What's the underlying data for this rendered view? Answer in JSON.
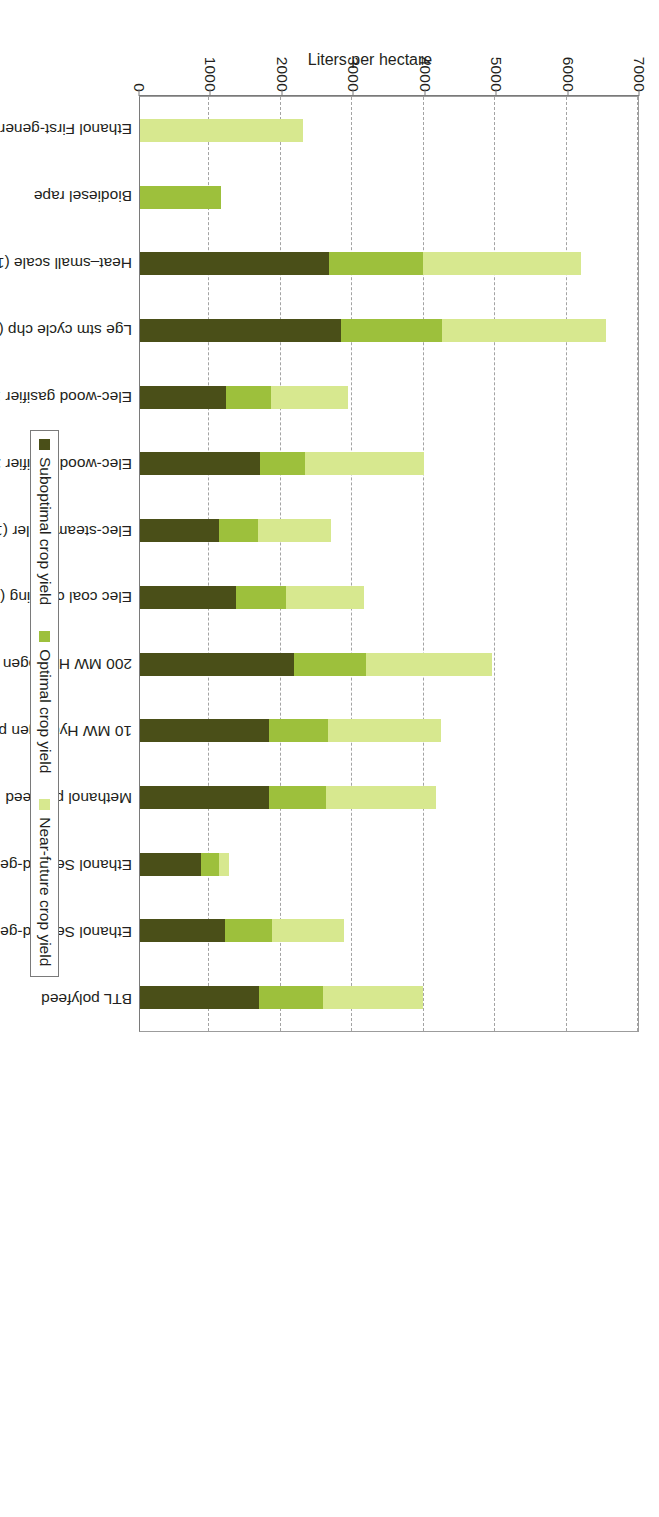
{
  "chart": {
    "type": "bar",
    "value_axis_title": "Liters per hectare",
    "value_axis_ticks": [
      "0",
      "1000",
      "2000",
      "3000",
      "4000",
      "5000",
      "6000",
      "7000"
    ]
  },
  "legend": {
    "items": [
      {
        "label": "Suboptimal crop yield",
        "color": "#4a4f18"
      },
      {
        "label": "Optimal crop yield",
        "color": "#9dc03c"
      },
      {
        "label": "Near-future crop yield",
        "color": "#d7e88f"
      }
    ]
  },
  "chart_data": {
    "type": "bar",
    "stacked": true,
    "title": "",
    "xlabel": "",
    "ylabel": "Liters per hectare",
    "ylim": [
      0,
      7000
    ],
    "ytick_step": 1000,
    "grid": true,
    "legend_position": "bottom",
    "categories": [
      "Ethanol First-generation wheat grain",
      "Biodiesel rape",
      "Heat–small scale (1 MWth) polyfeed",
      "Lge stm cycle chp (30 MWth + 12 MWe) polyfeed",
      "Elec-wood gasifier 10 MWth polyfeed",
      "Elec-wood gasifier 200 MWth polyfeed",
      "Elec-steam boiler (100% biomass) polyfeed",
      "Elec coal co-firing (10% max biomass) polyfeed",
      "200 MW Hydrogen polyfeed",
      "10 MW Hydrogen polyfeed",
      "Methanol polyfeed",
      "Ethanol Second-generation straw",
      "Ethanol Second-generation polyfeed",
      "BTL polyfeed"
    ],
    "series": [
      {
        "name": "Suboptimal crop yield",
        "color": "#4a4f18",
        "values": [
          0,
          0,
          2640,
          2820,
          1200,
          1680,
          1100,
          1350,
          2160,
          1810,
          1810,
          860,
          1190,
          1660
        ]
      },
      {
        "name": "Optimal crop yield",
        "color": "#9dc03c",
        "values": [
          0,
          1140,
          3960,
          4230,
          1830,
          2310,
          1650,
          2050,
          3170,
          2630,
          2600,
          1100,
          1850,
          2560
        ]
      },
      {
        "name": "Near-future crop yield",
        "color": "#d7e88f",
        "values": [
          2280,
          1140,
          6170,
          6530,
          2910,
          3980,
          2670,
          3140,
          4930,
          4220,
          4150,
          1250,
          2860,
          3960
        ]
      }
    ],
    "note": "Series values are cumulative stack tops in liters per hectare"
  }
}
